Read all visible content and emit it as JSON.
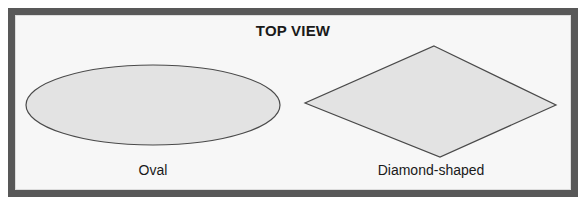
{
  "figure": {
    "title": "TOP VIEW",
    "background_color": "#f7f7f7",
    "frame_color": "#585858",
    "shape_fill_color": "#e3e3e3",
    "shape_stroke_color": "#4a4a4a",
    "text_color": "#1a1a1a",
    "shapes": [
      {
        "id": "oval",
        "kind": "ellipse",
        "caption": "Oval",
        "center": {
          "x": 153,
          "y": 105
        },
        "radius_x": 127,
        "radius_y": 40
      },
      {
        "id": "diamond",
        "kind": "polygon",
        "caption": "Diamond-shaped",
        "vertices": [
          {
            "x": 434,
            "y": 46
          },
          {
            "x": 556,
            "y": 105
          },
          {
            "x": 440,
            "y": 157
          },
          {
            "x": 305,
            "y": 103
          }
        ]
      }
    ]
  }
}
